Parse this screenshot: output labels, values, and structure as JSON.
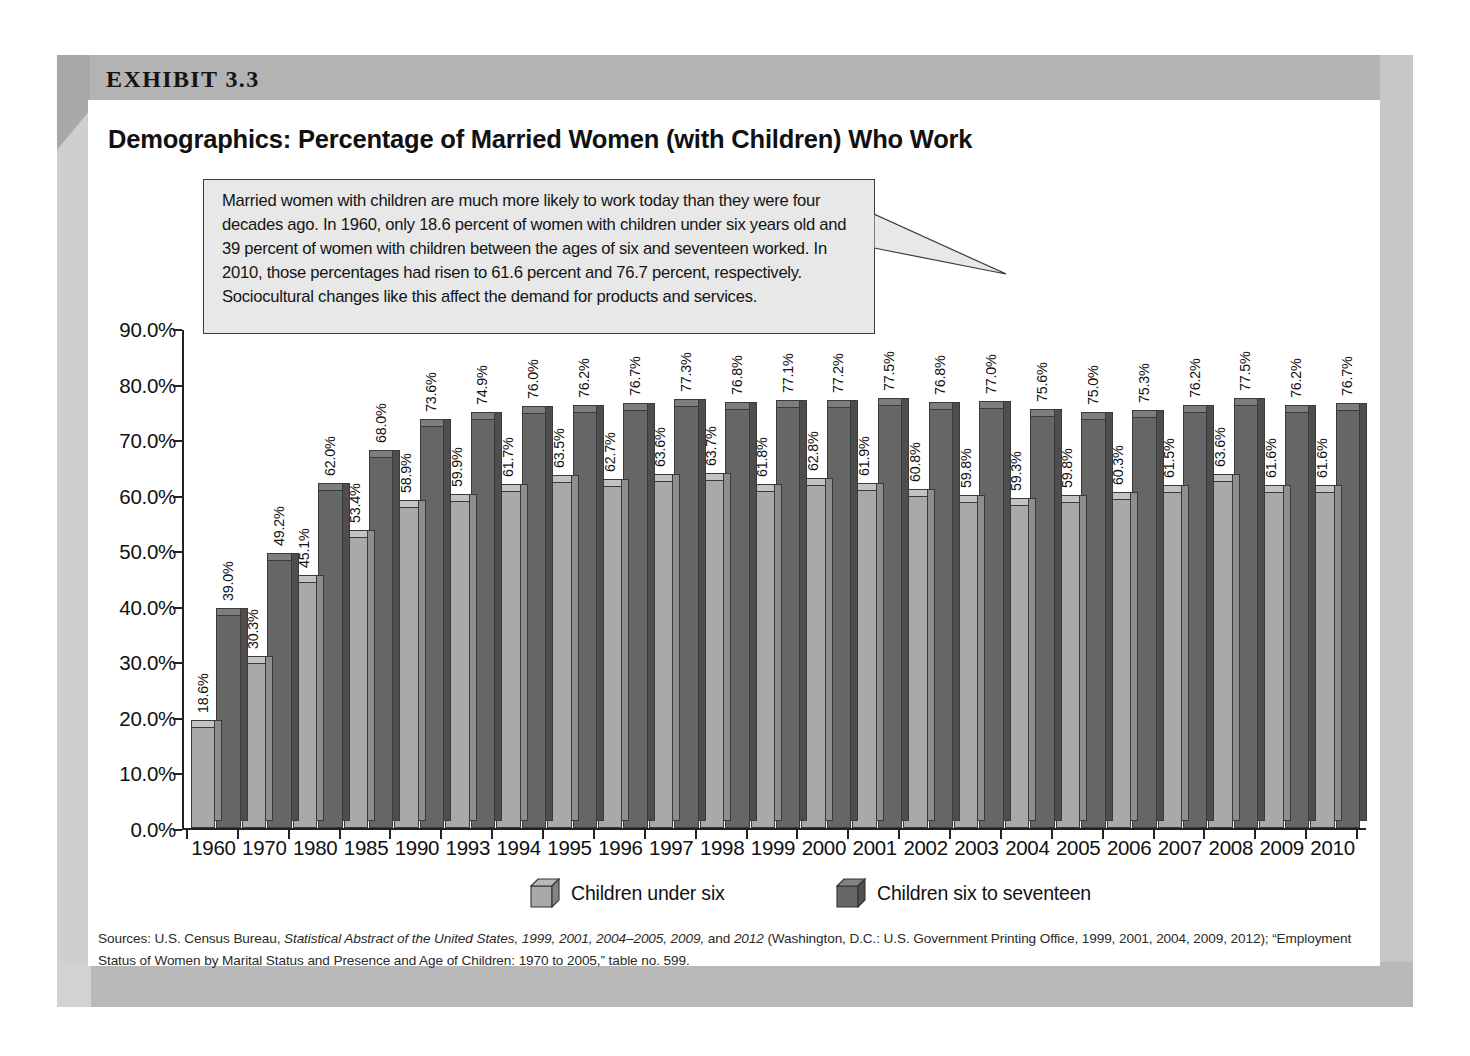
{
  "exhibit": {
    "label": "EXHIBIT 3.3",
    "title": "Demographics: Percentage of Married Women (with Children) Who Work"
  },
  "callout": {
    "text": "Married women with children are much more likely to work today than they were four decades ago. In 1960, only 18.6 percent of women with children under six years old and 39 percent of women with children between the ages of six and seventeen worked. In 2010, those percentages had risen to 61.6 percent and 76.7 percent, respectively. Sociocultural changes like this affect the demand for products and services."
  },
  "legend": {
    "items": [
      {
        "label": "Children under six",
        "color": "#a9a9a9"
      },
      {
        "label": "Children six to seventeen",
        "color": "#666666"
      }
    ]
  },
  "sources": {
    "prefix": "Sources: U.S. Census Bureau, ",
    "italic1": "Statistical Abstract of the United States, 1999, 2001, 2004–2005, 2009,",
    "mid": " and ",
    "italic2": "2012",
    "suffix": " (Washington, D.C.: U.S. Government Printing Office, 1999, 2001, 2004, 2009, 2012); “Employment Status of Women by Marital Status and Presence and Age of Children: 1970 to 2005,” table no. 599."
  },
  "chart_data": {
    "type": "bar",
    "title": "Demographics: Percentage of Married Women (with Children) Who Work",
    "xlabel": "",
    "ylabel": "",
    "ylim": [
      0,
      90
    ],
    "ytick_labels": [
      "0.0%",
      "10.0%",
      "20.0%",
      "30.0%",
      "40.0%",
      "50.0%",
      "60.0%",
      "70.0%",
      "80.0%",
      "90.0%"
    ],
    "ytick_values": [
      0,
      10,
      20,
      30,
      40,
      50,
      60,
      70,
      80,
      90
    ],
    "grid": false,
    "legend_position": "bottom",
    "categories": [
      "1960",
      "1970",
      "1980",
      "1985",
      "1990",
      "1993",
      "1994",
      "1995",
      "1996",
      "1997",
      "1998",
      "1999",
      "2000",
      "2001",
      "2002",
      "2003",
      "2004",
      "2005",
      "2006",
      "2007",
      "2008",
      "2009",
      "2010"
    ],
    "series": [
      {
        "name": "Children under six",
        "color": "#a9a9a9",
        "values": [
          18.6,
          30.3,
          45.1,
          53.4,
          58.9,
          59.9,
          61.7,
          63.5,
          62.7,
          63.6,
          63.7,
          61.8,
          62.8,
          61.9,
          60.8,
          59.8,
          59.3,
          59.8,
          60.3,
          61.5,
          63.6,
          61.6,
          61.6
        ],
        "labels": [
          "18.6%",
          "30.3%",
          "45.1%",
          "53.4%",
          "58.9%",
          "59.9%",
          "61.7%",
          "63.5%",
          "62.7%",
          "63.6%",
          "63.7%",
          "61.8%",
          "62.8%",
          "61.9%",
          "60.8%",
          "59.8%",
          "59.3%",
          "59.8%",
          "60.3%",
          "61.5%",
          "63.6%",
          "61.6%",
          "61.6%"
        ]
      },
      {
        "name": "Children six to seventeen",
        "color": "#666666",
        "values": [
          39.0,
          49.2,
          62.0,
          68.0,
          73.6,
          74.9,
          76.0,
          76.2,
          76.7,
          77.3,
          76.8,
          77.1,
          77.2,
          77.5,
          76.8,
          77.0,
          75.6,
          75.0,
          75.3,
          76.2,
          77.5,
          76.2,
          76.7
        ],
        "labels": [
          "39.0%",
          "49.2%",
          "62.0%",
          "68.0%",
          "73.6%",
          "74.9%",
          "76.0%",
          "76.2%",
          "76.7%",
          "77.3%",
          "76.8%",
          "77.1%",
          "77.2%",
          "77.5%",
          "76.8%",
          "77.0%",
          "75.6%",
          "75.0%",
          "75.3%",
          "76.2%",
          "77.5%",
          "76.2%",
          "76.7%"
        ]
      }
    ]
  }
}
